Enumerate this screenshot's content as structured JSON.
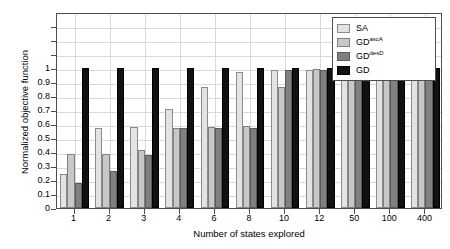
{
  "chart_data": {
    "type": "bar",
    "title": "",
    "xlabel": "Number of states explored",
    "ylabel": "Normalized objective function",
    "categories": [
      "1",
      "2",
      "3",
      "4",
      "6",
      "8",
      "10",
      "12",
      "50",
      "100",
      "400"
    ],
    "ylim": [
      0,
      1.4
    ],
    "yticks": [
      0,
      0.1,
      0.2,
      0.3,
      0.4,
      0.5,
      0.6,
      0.7,
      0.8,
      0.9,
      1
    ],
    "ytick_labels": [
      "0",
      "0.1",
      "0.2",
      "0.3",
      "0.4",
      "0.5",
      "0.6",
      "0.7",
      "0.8",
      "0.9",
      "1"
    ],
    "grid": true,
    "legend_position": "top-right",
    "series": [
      {
        "name": "SA",
        "name_base": "SA",
        "name_sup": "",
        "color": "#e3e3e3",
        "values": [
          0.24,
          0.575,
          0.58,
          0.71,
          0.865,
          0.97,
          0.985,
          0.985,
          0.985,
          0.985,
          0.995
        ]
      },
      {
        "name": "GDascA",
        "name_base": "GD",
        "name_sup": "ascA",
        "color": "#c8c8c8",
        "values": [
          0.385,
          0.385,
          0.415,
          0.57,
          0.58,
          0.585,
          0.865,
          0.995,
          0.99,
          0.99,
          0.995
        ]
      },
      {
        "name": "GDdesD",
        "name_base": "GD",
        "name_sup": "desD",
        "color": "#808080",
        "values": [
          0.18,
          0.265,
          0.38,
          0.57,
          0.57,
          0.57,
          0.985,
          0.985,
          0.985,
          0.98,
          0.98
        ]
      },
      {
        "name": "GD",
        "name_base": "GD",
        "name_sup": "",
        "color": "#111111",
        "values": [
          1.0,
          1.0,
          1.0,
          1.0,
          1.0,
          1.0,
          1.0,
          1.0,
          1.0,
          1.0,
          1.0
        ]
      }
    ]
  }
}
